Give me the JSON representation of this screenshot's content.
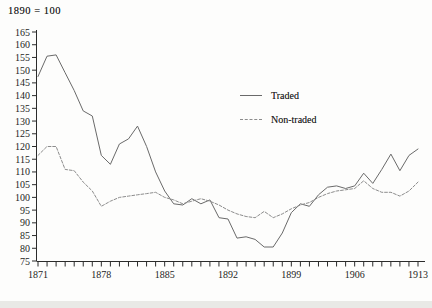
{
  "chart_data": {
    "type": "line",
    "title": "1890 = 100",
    "xlabel": "",
    "ylabel": "",
    "xlim": [
      1871,
      1913
    ],
    "ylim": [
      75,
      165
    ],
    "grid": false,
    "minor_x_tick_interval": 1,
    "x_tick_labels": [
      "1871",
      "1878",
      "1885",
      "1892",
      "1899",
      "1906",
      "1913"
    ],
    "y_tick_labels": [
      "75",
      "80",
      "85",
      "90",
      "95",
      "100",
      "105",
      "110",
      "115",
      "120",
      "125",
      "130",
      "135",
      "140",
      "145",
      "150",
      "155",
      "160",
      "165"
    ],
    "legend_position": "upper-center-right",
    "x": [
      1871,
      1872,
      1873,
      1874,
      1875,
      1876,
      1877,
      1878,
      1879,
      1880,
      1881,
      1882,
      1883,
      1884,
      1885,
      1886,
      1887,
      1888,
      1889,
      1890,
      1891,
      1892,
      1893,
      1894,
      1895,
      1896,
      1897,
      1898,
      1899,
      1900,
      1901,
      1902,
      1903,
      1904,
      1905,
      1906,
      1907,
      1908,
      1909,
      1910,
      1911,
      1912,
      1913
    ],
    "series": [
      {
        "name": "Traded",
        "line_style": "solid",
        "color": "#6a6a6a",
        "values": [
          147.5,
          155.5,
          156,
          149,
          142,
          134,
          132,
          116.5,
          113,
          121,
          123,
          128,
          120,
          110,
          102.5,
          97.5,
          97,
          99.5,
          97.5,
          99,
          92,
          91.5,
          84,
          84.5,
          83.5,
          80.5,
          80.5,
          86,
          94,
          97.5,
          96.5,
          101,
          104,
          104.5,
          103.5,
          104.5,
          109.5,
          105.5,
          111,
          117,
          110.5,
          116.5,
          119
        ]
      },
      {
        "name": "Non-traded",
        "line_style": "dashed",
        "color": "#8c8c8c",
        "values": [
          116.5,
          120,
          120,
          111,
          110.5,
          106,
          102.5,
          96.5,
          98.5,
          100,
          100.5,
          101,
          101.5,
          102,
          100,
          99,
          97.5,
          98.5,
          99.5,
          98.5,
          97,
          95,
          93.5,
          92.5,
          92,
          94.5,
          92,
          93.5,
          95.5,
          97,
          98,
          100,
          101.5,
          102.5,
          103,
          103.5,
          106.5,
          103.5,
          102,
          102,
          100.5,
          102.5,
          106
        ]
      }
    ]
  }
}
